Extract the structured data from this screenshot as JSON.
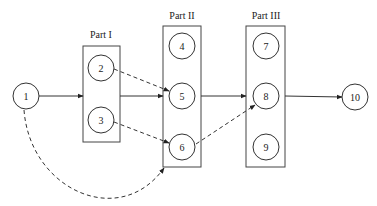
{
  "diagram": {
    "parts": [
      {
        "id": "part1",
        "label": "Part I",
        "x": 83,
        "y": 46,
        "w": 37,
        "h": 96
      },
      {
        "id": "part2",
        "label": "Part II",
        "x": 163,
        "y": 26,
        "w": 38,
        "h": 141
      },
      {
        "id": "part3",
        "label": "Part III",
        "x": 246,
        "y": 26,
        "w": 39,
        "h": 141
      }
    ],
    "nodes": [
      {
        "id": "1",
        "label": "1",
        "cx": 26,
        "cy": 96
      },
      {
        "id": "2",
        "label": "2",
        "cx": 101,
        "cy": 68
      },
      {
        "id": "3",
        "label": "3",
        "cx": 101,
        "cy": 120
      },
      {
        "id": "4",
        "label": "4",
        "cx": 182,
        "cy": 46
      },
      {
        "id": "5",
        "label": "5",
        "cx": 182,
        "cy": 96
      },
      {
        "id": "6",
        "label": "6",
        "cx": 182,
        "cy": 147
      },
      {
        "id": "7",
        "label": "7",
        "cx": 266,
        "cy": 46
      },
      {
        "id": "8",
        "label": "8",
        "cx": 266,
        "cy": 96
      },
      {
        "id": "9",
        "label": "9",
        "cx": 266,
        "cy": 147
      },
      {
        "id": "10",
        "label": "10",
        "cx": 355,
        "cy": 97
      }
    ],
    "edges": [
      {
        "from": "1",
        "to": "Part I",
        "style": "solid"
      },
      {
        "from": "Part I",
        "to": "5",
        "style": "solid"
      },
      {
        "from": "2",
        "to": "5",
        "style": "dashed"
      },
      {
        "from": "3",
        "to": "6",
        "style": "dashed"
      },
      {
        "from": "Part II",
        "to": "8",
        "style": "solid"
      },
      {
        "from": "6",
        "to": "8",
        "style": "dashed"
      },
      {
        "from": "8",
        "to": "10",
        "style": "solid"
      },
      {
        "from": "1",
        "to": "Part II",
        "style": "dashed-curve"
      }
    ]
  }
}
